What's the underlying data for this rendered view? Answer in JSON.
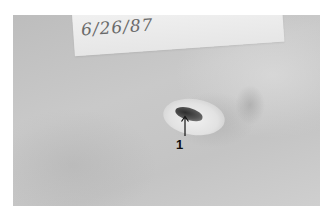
{
  "image": {
    "description": "Grayscale clinical photograph of a small skin wound with handwritten label",
    "handwritten_label": "6/26/87",
    "annotation": {
      "number": "1",
      "arrow_direction": "up"
    },
    "colors": {
      "background": "#ffffff",
      "skin": "#c4c4c4",
      "label_paper": "#ececec",
      "wound": "#3a3a3a",
      "annotation": "#111111"
    }
  }
}
